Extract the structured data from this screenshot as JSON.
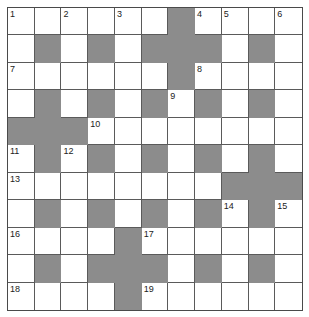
{
  "puzzle": {
    "type": "crossword",
    "rows": 11,
    "cols": 11,
    "colors": {
      "block": "#8c8c8c",
      "cell": "#ffffff",
      "line": "#5a5a5a",
      "number": "#222222"
    },
    "layout": [
      "......#....",
      ".#.#.###.#.",
      "......#....",
      ".#.#.#.#.#.",
      "###........",
      ".#.#.#.#.#.",
      "........###",
      ".#.#.#.#.#.",
      "....#......",
      ".#.###.#.#.",
      "....#......"
    ],
    "numbers": [
      {
        "n": "1",
        "r": 0,
        "c": 0
      },
      {
        "n": "2",
        "r": 0,
        "c": 2
      },
      {
        "n": "3",
        "r": 0,
        "c": 4
      },
      {
        "n": "4",
        "r": 0,
        "c": 7
      },
      {
        "n": "5",
        "r": 0,
        "c": 8
      },
      {
        "n": "6",
        "r": 0,
        "c": 10
      },
      {
        "n": "7",
        "r": 2,
        "c": 0
      },
      {
        "n": "8",
        "r": 2,
        "c": 7
      },
      {
        "n": "9",
        "r": 3,
        "c": 6
      },
      {
        "n": "10",
        "r": 4,
        "c": 3
      },
      {
        "n": "11",
        "r": 5,
        "c": 0
      },
      {
        "n": "12",
        "r": 5,
        "c": 2
      },
      {
        "n": "13",
        "r": 6,
        "c": 0
      },
      {
        "n": "14",
        "r": 7,
        "c": 8
      },
      {
        "n": "15",
        "r": 7,
        "c": 10
      },
      {
        "n": "16",
        "r": 8,
        "c": 0
      },
      {
        "n": "17",
        "r": 8,
        "c": 5
      },
      {
        "n": "18",
        "r": 10,
        "c": 0
      },
      {
        "n": "19",
        "r": 10,
        "c": 5
      }
    ]
  }
}
